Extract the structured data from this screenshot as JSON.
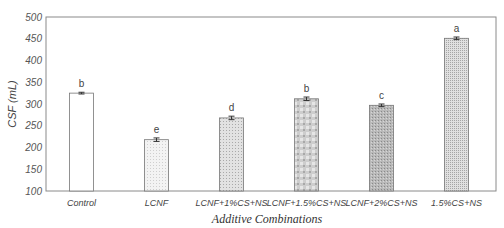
{
  "chart_data": {
    "type": "bar",
    "title": "",
    "xlabel": "Additive Combinations",
    "ylabel": "CSF (mL)",
    "ylim": [
      100,
      500
    ],
    "yticks": [
      100,
      150,
      200,
      250,
      300,
      350,
      400,
      450,
      500
    ],
    "grid": false,
    "legend": null,
    "categories": [
      "Control",
      "LCNF",
      "LCNF+1%CS+NS",
      "LCNF+1.5%CS+NS",
      "LCNF+2%CS+NS",
      "1.5%CS+NS"
    ],
    "values": [
      325,
      218,
      268,
      312,
      297,
      451
    ],
    "errors": [
      2,
      4,
      4,
      4,
      3,
      3
    ],
    "significance_letters": [
      "b",
      "e",
      "d",
      "b",
      "c",
      "a"
    ],
    "bar_fills": [
      "#ffffff",
      "#ececec",
      "#d6d6d6",
      "#c4c4c4",
      "#b0b0b0",
      "#cfcfcf"
    ]
  }
}
